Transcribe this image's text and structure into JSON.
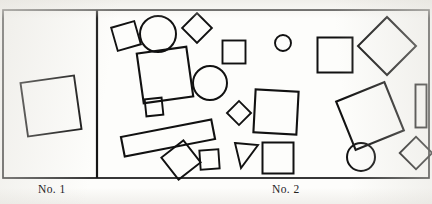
{
  "figure": {
    "type": "two-panel-shape-array-plate",
    "background_color": "#fdfdfb",
    "ink_color": "#1a1a1a",
    "frame": {
      "x": 3,
      "y": 10,
      "width": 426,
      "height": 168,
      "divider_x": 97,
      "stroke_width": 1.6
    },
    "panels": [
      {
        "id": "panel-1",
        "caption": "No. 1",
        "shape_count": 1,
        "description": "sparse panel containing a single slightly rotated square"
      },
      {
        "id": "panel-2",
        "caption": "No. 2",
        "shape_count": 22,
        "description": "dense panel containing many scattered squares, diamonds, circles, a triangle and a long bar"
      }
    ],
    "captions": {
      "left": "No. 1",
      "right": "No. 2"
    },
    "shapes": {
      "panel_1": [
        {
          "name": "square-left-panel",
          "kind": "square",
          "cx": 51,
          "cy": 106,
          "size": 54,
          "rotation": -8
        }
      ],
      "panel_2": [
        {
          "name": "small-square-top-left",
          "kind": "square",
          "cx": 126,
          "cy": 36,
          "size": 24,
          "rotation": -16
        },
        {
          "name": "circle-top-left",
          "kind": "circle",
          "cx": 158,
          "cy": 34,
          "r": 18
        },
        {
          "name": "diamond-top-upper",
          "kind": "diamond",
          "cx": 197,
          "cy": 28,
          "size": 21,
          "rotation": 45
        },
        {
          "name": "large-square-upper-left",
          "kind": "square",
          "cx": 165,
          "cy": 75,
          "size": 50,
          "rotation": -8
        },
        {
          "name": "circle-mid-left",
          "kind": "circle",
          "cx": 210,
          "cy": 83,
          "r": 17
        },
        {
          "name": "tiny-square-mid-left",
          "kind": "square",
          "cx": 154,
          "cy": 107,
          "size": 17,
          "rotation": -6
        },
        {
          "name": "square-upper-center",
          "kind": "square",
          "cx": 234,
          "cy": 52,
          "size": 23,
          "rotation": 0
        },
        {
          "name": "small-circle-top-center",
          "kind": "circle",
          "cx": 283,
          "cy": 43,
          "r": 8
        },
        {
          "name": "square-top-right-center",
          "kind": "square",
          "cx": 335,
          "cy": 55,
          "size": 35,
          "rotation": 0
        },
        {
          "name": "large-diamond-top-right",
          "kind": "diamond",
          "cx": 387,
          "cy": 46,
          "size": 41,
          "rotation": 45
        },
        {
          "name": "long-bar-lower-left",
          "kind": "rect",
          "cx": 168,
          "cy": 138,
          "width": 92,
          "height": 20,
          "rotation": -11
        },
        {
          "name": "rotated-square-bottom-left",
          "kind": "square",
          "cx": 181,
          "cy": 160,
          "size": 28,
          "rotation": -38
        },
        {
          "name": "square-bottom-left-edge",
          "kind": "square",
          "cx": 209,
          "cy": 159,
          "size": 19,
          "rotation": -4
        },
        {
          "name": "small-square-bottom-center-left",
          "kind": "square",
          "cx": 207,
          "cy": 161,
          "size": 19,
          "rotation": -3
        },
        {
          "name": "diamond-center",
          "kind": "diamond",
          "cx": 239,
          "cy": 113,
          "size": 17,
          "rotation": 45
        },
        {
          "name": "large-square-center",
          "kind": "square",
          "cx": 276,
          "cy": 112,
          "size": 43,
          "rotation": 3
        },
        {
          "name": "triangle-bottom-center",
          "kind": "triangle",
          "cx": 246,
          "cy": 155,
          "size": 25,
          "rotation": 0
        },
        {
          "name": "square-bottom-center",
          "kind": "square",
          "cx": 278,
          "cy": 158,
          "size": 31,
          "rotation": 0
        },
        {
          "name": "large-rotated-square-right",
          "kind": "square",
          "cx": 370,
          "cy": 116,
          "size": 52,
          "rotation": -22
        },
        {
          "name": "tall-rect-far-right",
          "kind": "rect",
          "cx": 421,
          "cy": 106,
          "width": 11,
          "height": 43,
          "rotation": 0
        },
        {
          "name": "circle-bottom-right",
          "kind": "circle",
          "cx": 361,
          "cy": 157,
          "r": 14
        },
        {
          "name": "diamond-bottom-right",
          "kind": "diamond",
          "cx": 416,
          "cy": 153,
          "size": 23,
          "rotation": 45
        }
      ]
    }
  }
}
